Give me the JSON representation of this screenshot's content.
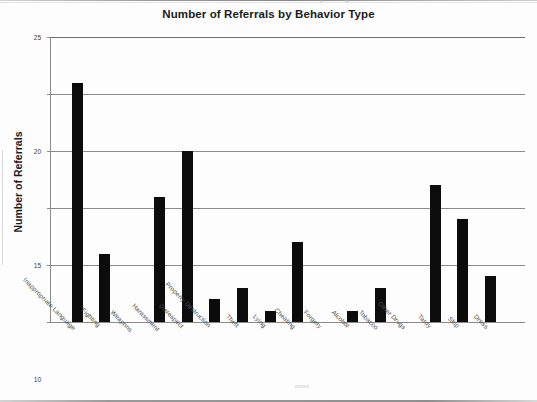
{
  "chart": {
    "title": "Number of Referrals by Behavior Type",
    "y_axis_title": "Number of Referrals"
  },
  "chart_data": {
    "type": "bar",
    "title": "Number of Referrals by Behavior Type",
    "xlabel": "",
    "ylabel": "Number of Referrals",
    "ylim": [
      0,
      25
    ],
    "yticks": [
      0,
      5,
      10,
      15,
      20,
      25
    ],
    "grid": true,
    "legend": false,
    "bar_color": "#0c0c0c",
    "categories": [
      "Inappropriate Language",
      "Fighting",
      "Weapons",
      "Harassment",
      "Disrespect",
      "Property Destruction",
      "Theft",
      "Lying",
      "Cheating",
      "Forgery",
      "Alcohol",
      "Tobacco",
      "Other Drugs",
      "Tardy",
      "Skip",
      "Dress"
    ],
    "values": [
      21,
      6,
      0,
      11,
      15,
      2,
      3,
      1,
      7,
      0,
      1,
      3,
      0,
      12,
      9,
      4
    ]
  }
}
